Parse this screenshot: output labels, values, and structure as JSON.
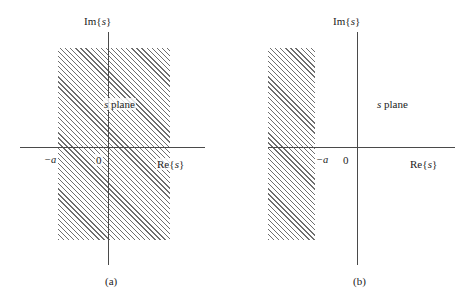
{
  "figure": {
    "background_color": "#ffffff",
    "ink_color": "#1c1c1c",
    "hatch_color": "#6e6e6e",
    "axis_color": "#4a4a4a"
  },
  "panels": [
    {
      "id": "a",
      "caption": "(a)",
      "plane_label_prefix": "s",
      "plane_label_suffix": "plane",
      "imaginary_axis_label": {
        "prefix": "Im",
        "open_brace": "{",
        "variable": "s",
        "close_brace": "}"
      },
      "real_axis_label": {
        "prefix": "Re",
        "open_brace": "{",
        "variable": "s",
        "close_brace": "}"
      },
      "origin_label": "0",
      "sigma_label": "−a",
      "region": {
        "description": "vertical strip Re{s} > -a, shaded",
        "left_boundary": "-a",
        "right_boundary": "open"
      }
    },
    {
      "id": "b",
      "caption": "(b)",
      "plane_label_prefix": "s",
      "plane_label_suffix": "plane",
      "imaginary_axis_label": {
        "prefix": "Im",
        "open_brace": "{",
        "variable": "s",
        "close_brace": "}"
      },
      "real_axis_label": {
        "prefix": "Re",
        "open_brace": "{",
        "variable": "s",
        "close_brace": "}"
      },
      "origin_label": "0",
      "sigma_label": "−a",
      "region": {
        "description": "vertical strip Re{s} < -a, shaded",
        "left_boundary": "open",
        "right_boundary": "-a"
      }
    }
  ]
}
